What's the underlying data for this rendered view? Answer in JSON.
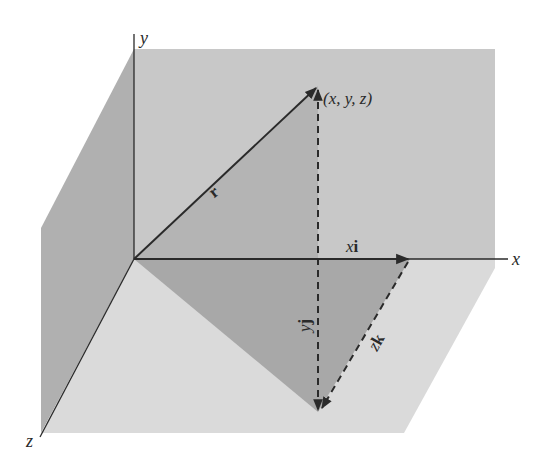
{
  "figure": {
    "type": "3d-position-vector-diagram",
    "axes": {
      "x_label": "x",
      "y_label": "y",
      "z_label": "z"
    },
    "point_label": "(x, y, z)",
    "vectors": {
      "r_label": "r",
      "xi_label_italic": "x",
      "xi_label_bold": "i",
      "yj_label_italic": "y",
      "yj_label_bold": "j",
      "zk_label_italic": "z",
      "zk_label_bold": "k"
    },
    "colors": {
      "back_wall": "#c8c8c8",
      "left_wall": "#b0b0b0",
      "floor": "#dadada",
      "triangle_upper": "#b4b4b4",
      "triangle_lower": "#a8a8a8",
      "lines": "#2a2a2a"
    }
  }
}
